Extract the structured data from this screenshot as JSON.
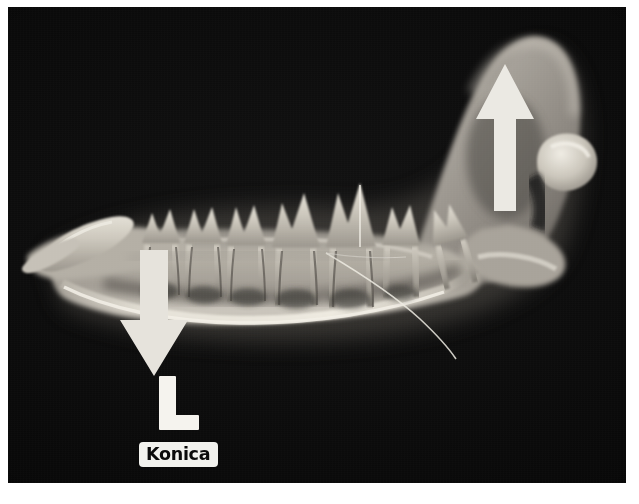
{
  "image": {
    "modality": "radiograph",
    "view": "lateral oblique mandible",
    "subject": "canine mandible",
    "background_color": "#040404",
    "frame_color": "#ffffff",
    "bone_color": "#d8d4cc"
  },
  "markers": {
    "arrow_up": {
      "name": "up-arrow-annotation",
      "direction": "up",
      "color": "#ebe9e3",
      "points_to": "mandibular ramus / coronoid process"
    },
    "arrow_down": {
      "name": "down-arrow-annotation",
      "direction": "down",
      "color": "#e6e3dc",
      "points_to": "ventral border of mandibular body"
    },
    "side_marker": {
      "label": "L",
      "meaning": "left",
      "color": "#f5f3ee"
    },
    "manufacturer_label": {
      "text": "Konica",
      "background": "#f2f2ee",
      "text_color": "#0b0b0b"
    }
  },
  "anatomy": {
    "structures": [
      "mandibular body",
      "mandibular ramus",
      "coronoid process",
      "condylar process",
      "angular process",
      "mandibular canine tooth",
      "premolar teeth",
      "molar teeth",
      "tooth roots",
      "ventral cortical border"
    ],
    "tooth_count": 7
  }
}
